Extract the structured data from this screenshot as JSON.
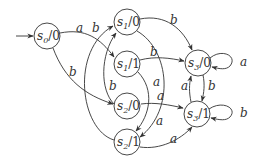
{
  "diagram": {
    "type": "state-machine",
    "start_state": "s0",
    "nodes": [
      {
        "id": "s0",
        "name": "s",
        "sub": "0",
        "output": "/0"
      },
      {
        "id": "s10",
        "name": "s",
        "sub": "1",
        "output": "/0"
      },
      {
        "id": "s11",
        "name": "s",
        "sub": "1",
        "output": "/1"
      },
      {
        "id": "s20",
        "name": "s",
        "sub": "2",
        "output": "/0"
      },
      {
        "id": "s21",
        "name": "s",
        "sub": "2",
        "output": "/1"
      },
      {
        "id": "s30",
        "name": "s",
        "sub": "3",
        "output": "/0"
      },
      {
        "id": "s31",
        "name": "s",
        "sub": "3",
        "output": "/1"
      }
    ],
    "edges": [
      {
        "from": "s0/0",
        "to": "s1/1",
        "label": "a"
      },
      {
        "from": "s0/0",
        "to": "s2/0",
        "label": "b"
      },
      {
        "from": "s1/0",
        "to": "s3/0",
        "label": "b"
      },
      {
        "from": "s1/0",
        "to": "s2/1",
        "label": "a"
      },
      {
        "from": "s1/1",
        "to": "s3/0",
        "label": "b"
      },
      {
        "from": "s1/1",
        "to": "s2/1",
        "label": "a"
      },
      {
        "from": "s2/0",
        "to": "s3/1",
        "label": "a"
      },
      {
        "from": "s2/0",
        "to": "s1/0",
        "label": "b"
      },
      {
        "from": "s2/1",
        "to": "s3/1",
        "label": "a"
      },
      {
        "from": "s2/1",
        "to": "s1/0",
        "label": "b"
      },
      {
        "from": "s3/0",
        "to": "s3/0",
        "label": "a"
      },
      {
        "from": "s3/0",
        "to": "s3/1",
        "label": "b"
      },
      {
        "from": "s3/1",
        "to": "s3/1",
        "label": "b"
      },
      {
        "from": "s3/1",
        "to": "s3/0",
        "label": "a"
      }
    ]
  }
}
